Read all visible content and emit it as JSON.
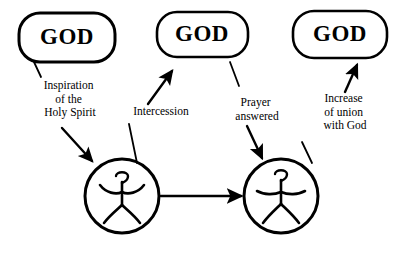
{
  "diagram": {
    "background_color": "#ffffff",
    "line_color": "#000000",
    "width": 408,
    "height": 253,
    "god_nodes": [
      {
        "id": "god-1",
        "label": "GOD",
        "x": 67,
        "y": 37,
        "rx": 48,
        "ry": 25
      },
      {
        "id": "god-2",
        "label": "GOD",
        "x": 202,
        "y": 34,
        "rx": 45,
        "ry": 23
      },
      {
        "id": "god-3",
        "label": "GOD",
        "x": 340,
        "y": 34,
        "rx": 47,
        "ry": 24
      }
    ],
    "person_nodes": [
      {
        "id": "person-1",
        "label": "praying person with raised arms",
        "cx": 122,
        "cy": 196,
        "r": 37
      },
      {
        "id": "person-2",
        "label": "praying person with outstretched arms",
        "cx": 281,
        "cy": 196,
        "r": 37
      }
    ],
    "edges": [
      {
        "id": "edge-inspiration",
        "from": "god-1",
        "to": "person-1",
        "label_lines": [
          "Inspiration",
          "of the",
          "Holy Spirit"
        ],
        "label_x": 70,
        "label_y": 89,
        "direction": "down"
      },
      {
        "id": "edge-intercession",
        "from": "person-1",
        "to": "god-2",
        "label_lines": [
          "Intercession"
        ],
        "label_x": 161,
        "label_y": 115,
        "direction": "up"
      },
      {
        "id": "edge-prayer-answered",
        "from": "god-2",
        "to": "person-2",
        "label_lines": [
          "Prayer",
          "answered"
        ],
        "label_x": 257,
        "label_y": 106,
        "direction": "down"
      },
      {
        "id": "edge-increase-union",
        "from": "person-2",
        "to": "god-3",
        "label_lines": [
          "Increase",
          "of union",
          "with God"
        ],
        "label_x": 345,
        "label_y": 102,
        "direction": "up"
      },
      {
        "id": "edge-person-to-person",
        "from": "person-1",
        "to": "person-2",
        "label_lines": [],
        "direction": "right"
      }
    ]
  }
}
